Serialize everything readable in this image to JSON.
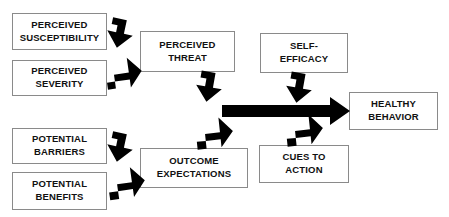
{
  "diagram": {
    "background_color": "#ffffff",
    "box_border_color": "#8a8a8a",
    "arrow_color": "#000000",
    "text_color": "#111111",
    "boxes": [
      {
        "id": "perceived-susceptibility",
        "lines": [
          "PERCEIVED",
          "SUSCEPTIBILITY"
        ],
        "x": 12,
        "y": 13,
        "w": 95,
        "h": 37
      },
      {
        "id": "perceived-severity",
        "lines": [
          "PERCEIVED",
          "SEVERITY"
        ],
        "x": 12,
        "y": 60,
        "w": 95,
        "h": 36
      },
      {
        "id": "perceived-threat",
        "lines": [
          "PERCEIVED",
          "THREAT"
        ],
        "x": 140,
        "y": 31,
        "w": 95,
        "h": 41
      },
      {
        "id": "self-efficacy",
        "lines": [
          "SELF-",
          "EFFICACY"
        ],
        "x": 260,
        "y": 33,
        "w": 88,
        "h": 40
      },
      {
        "id": "healthy-behavior",
        "lines": [
          "HEALTHY",
          "BEHAVIOR"
        ],
        "x": 349,
        "y": 92,
        "w": 89,
        "h": 38
      },
      {
        "id": "outcome-expectations",
        "lines": [
          "OUTCOME",
          "EXPECTATIONS"
        ],
        "x": 140,
        "y": 148,
        "w": 108,
        "h": 40
      },
      {
        "id": "cues-to-action",
        "lines": [
          "CUES TO",
          "ACTION"
        ],
        "x": 259,
        "y": 145,
        "w": 90,
        "h": 38
      },
      {
        "id": "potential-barriers",
        "lines": [
          "POTENTIAL",
          "BARRIERS"
        ],
        "x": 12,
        "y": 128,
        "w": 95,
        "h": 36
      },
      {
        "id": "potential-benefits",
        "lines": [
          "POTENTIAL",
          "BENEFITS"
        ],
        "x": 12,
        "y": 172,
        "w": 95,
        "h": 38
      }
    ],
    "arrows": [
      {
        "id": "susceptibility-to-threat",
        "type": "block-diagonal",
        "direction": "down-right",
        "from": "perceived-susceptibility",
        "to": "perceived-threat"
      },
      {
        "id": "severity-to-threat",
        "type": "block-diagonal",
        "direction": "up-right",
        "from": "perceived-severity",
        "to": "perceived-threat"
      },
      {
        "id": "barriers-to-outcome",
        "type": "block-diagonal",
        "direction": "down-right",
        "from": "potential-barriers",
        "to": "outcome-expectations"
      },
      {
        "id": "benefits-to-outcome",
        "type": "block-diagonal",
        "direction": "up-right",
        "from": "potential-benefits",
        "to": "outcome-expectations"
      },
      {
        "id": "threat-to-main",
        "type": "block-diagonal",
        "direction": "down-right",
        "from": "perceived-threat",
        "to": "main-arrow"
      },
      {
        "id": "outcome-to-main",
        "type": "block-diagonal",
        "direction": "up-right",
        "from": "outcome-expectations",
        "to": "main-arrow"
      },
      {
        "id": "self-efficacy-to-main",
        "type": "block-diagonal",
        "direction": "down-right",
        "from": "self-efficacy",
        "to": "main-arrow"
      },
      {
        "id": "cues-to-action-to-main",
        "type": "block-diagonal",
        "direction": "up-right",
        "from": "cues-to-action",
        "to": "main-arrow"
      },
      {
        "id": "main-arrow",
        "type": "block-horizontal",
        "direction": "right",
        "from": "determinants",
        "to": "healthy-behavior"
      }
    ]
  }
}
